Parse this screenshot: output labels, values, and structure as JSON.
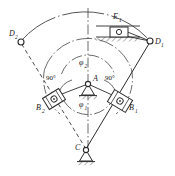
{
  "diagram": {
    "type": "kinematic-schematic",
    "stroke_color": "#2b2b2b",
    "text_color": "#1a1a1a",
    "background_color": "#ffffff",
    "labels": {
      "pivot_a": "A",
      "pivot_c": "C",
      "slider_e1": "E",
      "slider_e1_sub": "1",
      "joint_d1": "D",
      "joint_d1_sub": "1",
      "joint_d2": "D",
      "joint_d2_sub": "2",
      "block_b1": "B",
      "block_b1_sub": "1",
      "block_b2": "B",
      "block_b2_sub": "2",
      "angle_phi1": "φ",
      "angle_phi1_sub": "1",
      "angle_phi2": "φ",
      "angle_phi2_sub": "2",
      "right_angle_left": "90°",
      "right_angle_right": "90°"
    },
    "nodes": [
      {
        "name": "A",
        "x": 88,
        "y": 84,
        "kind": "fixed-pivot"
      },
      {
        "name": "C",
        "x": 86,
        "y": 152,
        "kind": "fixed-pivot"
      },
      {
        "name": "B1",
        "x": 120,
        "y": 101,
        "kind": "slider-block"
      },
      {
        "name": "B2",
        "x": 54,
        "y": 99,
        "kind": "slider-block"
      },
      {
        "name": "D1",
        "x": 150,
        "y": 41,
        "kind": "pin-joint"
      },
      {
        "name": "D2",
        "x": 21,
        "y": 41,
        "kind": "pin-joint"
      },
      {
        "name": "E1",
        "x": 118,
        "y": 32,
        "kind": "slider-on-guide"
      }
    ],
    "links": [
      {
        "from": "C",
        "to": "D1",
        "style": "solid",
        "label": "position 1 rocker"
      },
      {
        "from": "C",
        "to": "D2",
        "style": "dashed",
        "label": "position 2 rocker"
      },
      {
        "from": "A",
        "to": "B1",
        "style": "solid",
        "label": "crank arm 1"
      },
      {
        "from": "A",
        "to": "B2",
        "style": "solid",
        "label": "crank arm 2"
      },
      {
        "from": "D1",
        "to": "E1",
        "style": "solid",
        "label": "coupler to slider"
      }
    ],
    "arcs": [
      {
        "name": "outer-path-arc",
        "radius": 75,
        "style": "solid",
        "from_deg": 205,
        "to_deg": 335
      },
      {
        "name": "phi2-arc",
        "radius": 44,
        "style": "dashdot",
        "from_deg": 200,
        "to_deg": 340
      },
      {
        "name": "phi1-arc",
        "radius": 25,
        "style": "dashdot",
        "from_deg": 195,
        "to_deg": 345
      }
    ],
    "centerline": {
      "name": "vertical-axis",
      "style": "dashdot",
      "x": 88
    }
  }
}
